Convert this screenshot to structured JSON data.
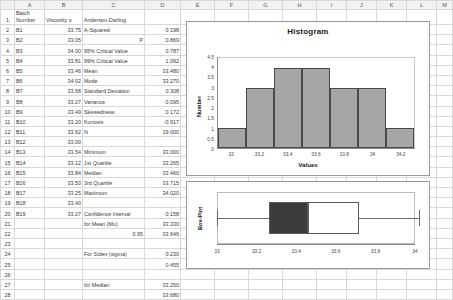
{
  "sheet": {
    "column_headers": [
      "A",
      "B",
      "C",
      "D",
      "E",
      "F",
      "G",
      "H",
      "I",
      "J",
      "K",
      "L",
      "M"
    ],
    "row_numbers": [
      "1",
      "2",
      "3",
      "4",
      "5",
      "6",
      "7",
      "8",
      "9",
      "10",
      "11",
      "12",
      "13",
      "14",
      "15",
      "16",
      "17",
      "18",
      "19",
      "20",
      "21",
      "22",
      "23",
      "24",
      "25",
      "26",
      "27",
      "28"
    ],
    "header_row": {
      "a": "Batch Number",
      "a_line1": "Batch",
      "a_line2": "Number",
      "b": "Viscosity o",
      "c": "Anderson-Darling",
      "d": ""
    },
    "rows": [
      {
        "n": "2",
        "a": "B1",
        "b": "33.75",
        "c": "A-Squared",
        "c_align": "left",
        "d": "0.198"
      },
      {
        "n": "3",
        "a": "B2",
        "b": "33.05",
        "c": "P",
        "c_align": "right",
        "d": "0.869"
      },
      {
        "n": "4",
        "a": "B3",
        "b": "34.00",
        "c": "95% Critical Value",
        "c_align": "left",
        "d": "0.787"
      },
      {
        "n": "5",
        "a": "B4",
        "b": "33.81",
        "c": "99% Critical Value",
        "c_align": "left",
        "d": "1.092"
      },
      {
        "n": "6",
        "a": "B5",
        "b": "33.46",
        "c": "Mean",
        "c_align": "left",
        "d": "33.480"
      },
      {
        "n": "7",
        "a": "B6",
        "b": "34.02",
        "c": "Mode",
        "c_align": "left",
        "d": "33.270"
      },
      {
        "n": "8",
        "a": "B7",
        "b": "33.68",
        "c": "Standard Deviation",
        "c_align": "left",
        "d": "0.308"
      },
      {
        "n": "9",
        "a": "B8",
        "b": "33.27",
        "c": "Variance",
        "c_align": "left",
        "d": "0.095"
      },
      {
        "n": "10",
        "a": "B9",
        "b": "33.49",
        "c": "Skewedness",
        "c_align": "left",
        "d": "0.172"
      },
      {
        "n": "11",
        "a": "B10",
        "b": "33.20",
        "c": "Kurtosis",
        "c_align": "left",
        "d": "-0.917"
      },
      {
        "n": "12",
        "a": "B11",
        "b": "33.62",
        "c": "N",
        "c_align": "left",
        "d": "19.000"
      },
      {
        "n": "13",
        "a": "B12",
        "b": "33.00",
        "c": "",
        "c_align": "left",
        "d": ""
      },
      {
        "n": "14",
        "a": "B13",
        "b": "33.54",
        "c": "Minimum",
        "c_align": "left",
        "d": "33.000"
      },
      {
        "n": "15",
        "a": "B14",
        "b": "33.12",
        "c": "1st Quartile",
        "c_align": "left",
        "d": "33.265"
      },
      {
        "n": "16",
        "a": "B15",
        "b": "33.84",
        "c": "Median",
        "c_align": "left",
        "d": "33.460"
      },
      {
        "n": "17",
        "a": "B16",
        "b": "33.50",
        "c": "3rd Quartile",
        "c_align": "left",
        "d": "33.715"
      },
      {
        "n": "18",
        "a": "B17",
        "b": "33.25",
        "c": "Maximum",
        "c_align": "left",
        "d": "34.020"
      },
      {
        "n": "19",
        "a": "B18",
        "b": "33.40",
        "c": "",
        "c_align": "left",
        "d": ""
      },
      {
        "n": "20",
        "a": "B19",
        "b": "33.27",
        "c": "Confidence Interval",
        "c_align": "left",
        "d": "0.158"
      },
      {
        "n": "21",
        "a": "",
        "b": "",
        "c": "for Mean (Mu)",
        "c_align": "left",
        "d": "33.330"
      },
      {
        "n": "22",
        "a": "",
        "b": "",
        "c": "0.95",
        "c_align": "right",
        "d": "33.646"
      },
      {
        "n": "23",
        "a": "",
        "b": "",
        "c": "",
        "c_align": "left",
        "d": ""
      },
      {
        "n": "24",
        "a": "",
        "b": "",
        "c": "For Stdev (sigma)",
        "c_align": "left",
        "d": "0.230"
      },
      {
        "n": "25",
        "a": "",
        "b": "",
        "c": "",
        "c_align": "left",
        "d": "0.455"
      },
      {
        "n": "26",
        "a": "",
        "b": "",
        "c": "",
        "c_align": "left",
        "d": ""
      },
      {
        "n": "27",
        "a": "",
        "b": "",
        "c": "for Median",
        "c_align": "left",
        "d": "33.250"
      },
      {
        "n": "28",
        "a": "",
        "b": "",
        "c": "",
        "c_align": "left",
        "d": "33.680"
      }
    ]
  },
  "chart_data": [
    {
      "type": "bar",
      "name": "histogram",
      "title": "Histogram",
      "xlabel": "Values",
      "ylabel": "Number",
      "categories": [
        "33",
        "33.2",
        "33.4",
        "33.6",
        "33.8",
        "34",
        "34.2"
      ],
      "values": [
        1,
        3,
        4,
        4,
        3,
        3,
        1
      ],
      "ylim": [
        0,
        4.5
      ],
      "yticks": [
        "0",
        "0.5",
        "1",
        "1.5",
        "2",
        "2.5",
        "3",
        "3.5",
        "4",
        "4.5"
      ],
      "xticks": [
        "33",
        "33.2",
        "33.4",
        "33.6",
        "33.8",
        "34",
        "34.2"
      ],
      "grid": false,
      "legend": "none",
      "bar_color": "#a6a6a6",
      "bar_border": "#4a4a4a"
    },
    {
      "type": "boxplot",
      "name": "box-plot",
      "title": "",
      "ylabel": "Box-Plot",
      "xlim": [
        33,
        34
      ],
      "xticks": [
        "33",
        "33.2",
        "33.4",
        "33.6",
        "33.8",
        "34"
      ],
      "minimum": 33.0,
      "q1": 33.265,
      "median": 33.46,
      "q3": 33.715,
      "maximum": 34.02,
      "q1_box_color": "#3c3c3c",
      "q3_box_color": "#ffffff"
    }
  ]
}
